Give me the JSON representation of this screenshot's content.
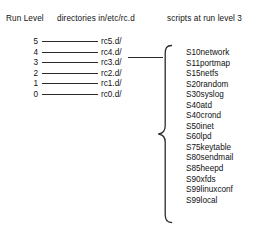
{
  "headings": {
    "run_level": "Run Level",
    "directories": "directories in/etc/rc.d",
    "scripts": "scripts at run level 3"
  },
  "run_levels": [
    {
      "level": "5",
      "directory": "rc5.d/"
    },
    {
      "level": "4",
      "directory": "rc4.d/"
    },
    {
      "level": "3",
      "directory": "rc3.d/"
    },
    {
      "level": "2",
      "directory": "rc2.d/"
    },
    {
      "level": "1",
      "directory": "rc1.d/"
    },
    {
      "level": "0",
      "directory": "rc0.d/"
    }
  ],
  "highlighted_run_level": "3",
  "scripts": [
    "S10network",
    "S11portmap",
    "S15netfs",
    "S20random",
    "S30syslog",
    "S40atd",
    "S40crond",
    "S50inet",
    "S60lpd",
    "S75keytable",
    "S80sendmail",
    "S85heepd",
    "S90xfds",
    "S99linuxconf",
    "S99local"
  ],
  "colors": {
    "background": "#ffffff",
    "text": "#111111",
    "stroke": "#2b2b2b"
  }
}
